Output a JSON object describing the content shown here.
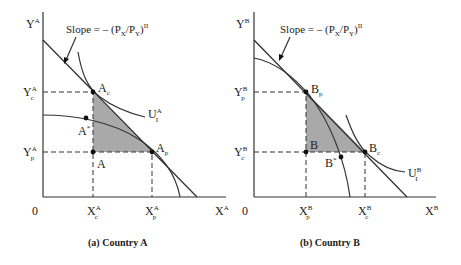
{
  "panels": [
    {
      "id": "a",
      "caption": "(a)  Country A",
      "y_axis_label": "Y",
      "y_axis_sup": "A",
      "x_axis_label": "X",
      "x_axis_sup": "A",
      "origin": "0",
      "slope_label": "Slope = – (P",
      "slope_label_x": "X",
      "slope_label_mid": "/P",
      "slope_label_y": "Y",
      "slope_label_end": ")",
      "slope_label_sup": "II",
      "y_ticks": [
        {
          "main": "Y",
          "sup": "A",
          "sub": "c"
        },
        {
          "main": "Y",
          "sup": "A",
          "sub": "p"
        }
      ],
      "x_ticks": [
        {
          "main": "X",
          "sup": "A",
          "sub": "c"
        },
        {
          "main": "X",
          "sup": "A",
          "sub": "p"
        }
      ],
      "points": [
        {
          "main": "A",
          "sub": "c",
          "sup": ""
        },
        {
          "main": "A",
          "sub": "",
          "sup": "*"
        },
        {
          "main": "A",
          "sub": "",
          "sup": ""
        },
        {
          "main": "A",
          "sub": "p",
          "sup": ""
        }
      ],
      "indifference_curve": {
        "main": "U",
        "sub": "I",
        "sup": "A"
      }
    },
    {
      "id": "b",
      "caption": "(b)  Country B",
      "y_axis_label": "Y",
      "y_axis_sup": "B",
      "x_axis_label": "X",
      "x_axis_sup": "B",
      "origin": "0",
      "slope_label": "Slope = – (P",
      "slope_label_x": "X",
      "slope_label_mid": "/P",
      "slope_label_y": "Y",
      "slope_label_end": ")",
      "slope_label_sup": "II",
      "y_ticks": [
        {
          "main": "Y",
          "sup": "B",
          "sub": "p"
        },
        {
          "main": "Y",
          "sup": "B",
          "sub": "c"
        }
      ],
      "x_ticks": [
        {
          "main": "X",
          "sup": "B",
          "sub": "p"
        },
        {
          "main": "X",
          "sup": "B",
          "sub": "c"
        }
      ],
      "points": [
        {
          "main": "B",
          "sub": "p",
          "sup": ""
        },
        {
          "main": "B",
          "sub": "",
          "sup": ""
        },
        {
          "main": "B",
          "sub": "",
          "sup": "*"
        },
        {
          "main": "B",
          "sub": "c",
          "sup": ""
        }
      ],
      "indifference_curve": {
        "main": "U",
        "sub": "I",
        "sup": "B"
      }
    }
  ],
  "colors": {
    "shade": "#a9a9a9",
    "line": "#333333"
  }
}
